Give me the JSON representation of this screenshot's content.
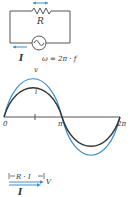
{
  "colors": {
    "wire": "#555555",
    "blue": "#3a8fd0",
    "voltage_curve": "#3a8fd0",
    "current_curve": "#333333",
    "axis": "#555555"
  },
  "circuit": {
    "resistor_label": "R",
    "current_label": "I",
    "omega_label": "ω = 2π · f",
    "source_icon": "ac-source-icon"
  },
  "waveform": {
    "voltage_label": "v",
    "current_label": "i",
    "tick_labels": [
      "0",
      "π",
      "2π"
    ]
  },
  "phasor": {
    "drop_label": "R · I",
    "voltage_label": "V",
    "current_label": "I"
  }
}
